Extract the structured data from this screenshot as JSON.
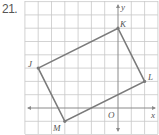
{
  "problem": {
    "number": "21."
  },
  "axes": {
    "x_label": "x",
    "y_label": "y",
    "origin_label": "O"
  },
  "vertices": [
    {
      "label": "J",
      "x": -6,
      "y": 3
    },
    {
      "label": "K",
      "x": 0,
      "y": 6
    },
    {
      "label": "L",
      "x": 2,
      "y": 2
    },
    {
      "label": "M",
      "x": -4,
      "y": -1
    }
  ],
  "grid": {
    "x_range": [
      -7,
      3
    ],
    "y_range": [
      -2,
      8
    ],
    "unit_px": 13.3
  },
  "colors": {
    "grid": "#c8c8c8",
    "axis": "#8a8a8a",
    "shape": "#7a7a7a",
    "text": "#555555"
  }
}
